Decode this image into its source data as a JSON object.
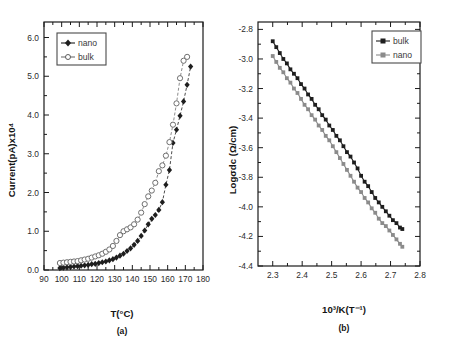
{
  "figure": {
    "background": "#ffffff",
    "colors": {
      "dark": "#1e1e1e",
      "gray": "#8b8b8b",
      "axis": "#1a1a1a"
    }
  },
  "panel_a": {
    "caption": "(a)",
    "xlabel": "T(°C)",
    "ylabel": "Current(pA)x10⁴",
    "legend": [
      {
        "label": "nano",
        "marker": "filled-diamond",
        "color": "#1e1e1e"
      },
      {
        "label": "bulk",
        "marker": "open-circle",
        "color": "#6f6f6f"
      }
    ],
    "xticks": [
      "90",
      "100",
      "110",
      "120",
      "130",
      "140",
      "150",
      "160",
      "170",
      "180"
    ],
    "yticks": [
      "0.0",
      "1.0",
      "2.0",
      "3.0",
      "4.0",
      "5.0",
      "6.0"
    ]
  },
  "panel_b": {
    "caption": "(b)",
    "xlabel": "10³/K(T⁻¹)",
    "ylabel": "Logσdc (Ω/cm)",
    "legend": [
      {
        "label": "bulk",
        "marker": "filled-square",
        "color": "#1e1e1e"
      },
      {
        "label": "nano",
        "marker": "filled-square",
        "color": "#8b8b8b"
      }
    ],
    "xticks": [
      "2.3",
      "2.4",
      "2.5",
      "2.6",
      "2.7",
      "2.8"
    ],
    "yticks": [
      "-2.8",
      "-3.0",
      "-3.2",
      "-3.4",
      "-3.6",
      "-3.8",
      "-4.0",
      "-4.2",
      "-4.4"
    ]
  },
  "chart_data": [
    {
      "type": "scatter",
      "panel": "(a)",
      "title": "",
      "xlabel": "T(°C)",
      "ylabel": "Current(pA)x10⁴",
      "xlim": [
        90,
        180
      ],
      "ylim": [
        0.0,
        6.4
      ],
      "grid": false,
      "legend_position": "top-left",
      "series": [
        {
          "name": "nano",
          "marker": "filled-diamond",
          "color": "#1e1e1e",
          "x": [
            99,
            101,
            103,
            105,
            107,
            109,
            111,
            113,
            115,
            117,
            119,
            121,
            123,
            125,
            127,
            129,
            131,
            133,
            135,
            137,
            139,
            141,
            143,
            145,
            147,
            149,
            151,
            153,
            155,
            157,
            159,
            161,
            163,
            165,
            167,
            169,
            171,
            173
          ],
          "y": [
            0.05,
            0.06,
            0.07,
            0.08,
            0.09,
            0.1,
            0.11,
            0.12,
            0.13,
            0.15,
            0.16,
            0.18,
            0.2,
            0.22,
            0.25,
            0.28,
            0.32,
            0.37,
            0.42,
            0.49,
            0.56,
            0.65,
            0.75,
            0.88,
            1.02,
            1.18,
            1.32,
            1.42,
            1.55,
            1.75,
            2.2,
            2.58,
            3.28,
            3.62,
            3.98,
            4.35,
            4.78,
            5.25
          ]
        },
        {
          "name": "bulk",
          "marker": "open-circle",
          "color": "#6f6f6f",
          "x": [
            99,
            101,
            103,
            105,
            107,
            109,
            111,
            113,
            115,
            117,
            119,
            121,
            123,
            125,
            127,
            129,
            131,
            133,
            135,
            137,
            139,
            141,
            143,
            145,
            147,
            149,
            151,
            153,
            155,
            157,
            159,
            161,
            163,
            165,
            167,
            169,
            171
          ],
          "y": [
            0.18,
            0.19,
            0.2,
            0.21,
            0.22,
            0.23,
            0.25,
            0.27,
            0.29,
            0.32,
            0.35,
            0.38,
            0.42,
            0.47,
            0.53,
            0.62,
            0.75,
            0.9,
            1.0,
            1.05,
            1.1,
            1.18,
            1.3,
            1.48,
            1.7,
            1.9,
            2.05,
            2.25,
            2.55,
            2.7,
            2.95,
            3.3,
            3.75,
            4.3,
            4.95,
            5.4,
            5.5
          ]
        }
      ]
    },
    {
      "type": "line",
      "panel": "(b)",
      "title": "",
      "xlabel": "10³/K(T⁻¹)",
      "ylabel": "Logσdc (Ω/cm)",
      "xlim": [
        2.25,
        2.8
      ],
      "ylim": [
        -4.4,
        -2.75
      ],
      "grid": false,
      "legend_position": "top-right",
      "series": [
        {
          "name": "bulk",
          "marker": "filled-square",
          "color": "#1e1e1e",
          "x": [
            2.3,
            2.312,
            2.324,
            2.336,
            2.348,
            2.36,
            2.372,
            2.384,
            2.396,
            2.408,
            2.42,
            2.432,
            2.444,
            2.456,
            2.468,
            2.48,
            2.492,
            2.504,
            2.516,
            2.528,
            2.54,
            2.552,
            2.564,
            2.576,
            2.588,
            2.6,
            2.612,
            2.624,
            2.636,
            2.648,
            2.66,
            2.672,
            2.684,
            2.696,
            2.708,
            2.72,
            2.732,
            2.74
          ],
          "y": [
            -2.88,
            -2.92,
            -2.96,
            -3.0,
            -3.03,
            -3.07,
            -3.1,
            -3.13,
            -3.17,
            -3.2,
            -3.24,
            -3.27,
            -3.31,
            -3.34,
            -3.38,
            -3.41,
            -3.45,
            -3.48,
            -3.52,
            -3.55,
            -3.59,
            -3.63,
            -3.66,
            -3.7,
            -3.74,
            -3.79,
            -3.83,
            -3.86,
            -3.9,
            -3.94,
            -3.97,
            -4.0,
            -4.03,
            -4.06,
            -4.09,
            -4.11,
            -4.14,
            -4.15
          ]
        },
        {
          "name": "nano",
          "marker": "filled-square",
          "color": "#8b8b8b",
          "x": [
            2.3,
            2.312,
            2.324,
            2.336,
            2.348,
            2.36,
            2.372,
            2.384,
            2.396,
            2.408,
            2.42,
            2.432,
            2.444,
            2.456,
            2.468,
            2.48,
            2.492,
            2.504,
            2.516,
            2.528,
            2.54,
            2.552,
            2.564,
            2.576,
            2.588,
            2.6,
            2.612,
            2.624,
            2.636,
            2.648,
            2.66,
            2.672,
            2.684,
            2.696,
            2.708,
            2.72,
            2.732,
            2.74
          ],
          "y": [
            -2.98,
            -3.02,
            -3.06,
            -3.09,
            -3.13,
            -3.16,
            -3.2,
            -3.23,
            -3.27,
            -3.31,
            -3.34,
            -3.38,
            -3.41,
            -3.45,
            -3.48,
            -3.52,
            -3.55,
            -3.59,
            -3.63,
            -3.67,
            -3.71,
            -3.75,
            -3.79,
            -3.83,
            -3.87,
            -3.9,
            -3.94,
            -3.97,
            -4.01,
            -4.04,
            -4.08,
            -4.11,
            -4.13,
            -4.16,
            -4.19,
            -4.22,
            -4.25,
            -4.27
          ]
        }
      ]
    }
  ]
}
